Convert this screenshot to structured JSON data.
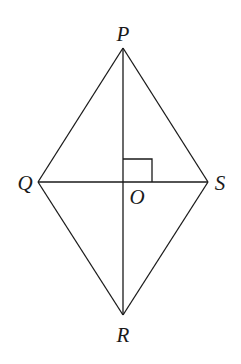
{
  "diagram": {
    "type": "rhombus-with-diagonals",
    "vertices": [
      {
        "id": "P",
        "label": "P",
        "x": 123,
        "y": 48,
        "label_x": 123,
        "label_y": 41
      },
      {
        "id": "Q",
        "label": "Q",
        "x": 38,
        "y": 182,
        "label_x": 25,
        "label_y": 190
      },
      {
        "id": "S",
        "label": "S",
        "x": 208,
        "y": 182,
        "label_x": 220,
        "label_y": 190
      },
      {
        "id": "R",
        "label": "R",
        "x": 123,
        "y": 315,
        "label_x": 123,
        "label_y": 342
      },
      {
        "id": "O",
        "label": "O",
        "x": 123,
        "y": 182,
        "label_x": 137,
        "label_y": 204
      }
    ],
    "edges": [
      [
        "P",
        "Q"
      ],
      [
        "P",
        "S"
      ],
      [
        "Q",
        "R"
      ],
      [
        "S",
        "R"
      ]
    ],
    "diagonals": [
      [
        "P",
        "R"
      ],
      [
        "Q",
        "S"
      ]
    ],
    "right_angle_marker": {
      "at": "O",
      "between": [
        "P",
        "S"
      ],
      "size": 29
    },
    "colors": {
      "stroke": "#1a1a1a",
      "background": "#ffffff"
    }
  }
}
